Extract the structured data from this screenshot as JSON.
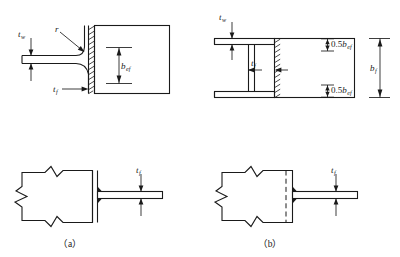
{
  "figure": {
    "captions": [
      {
        "id": "a",
        "label": "（a）"
      },
      {
        "id": "b",
        "label": "（b）"
      }
    ],
    "labels": {
      "web_thickness": "t",
      "web_thickness_sub": "w",
      "flange_thickness": "t",
      "flange_thickness_sub": "f",
      "fillet_radius": "r",
      "effective_width": "b",
      "effective_width_sub": "ef",
      "half_effective_width_value": "0.5",
      "half_effective_width": "b",
      "half_effective_width_sub": "ef",
      "flange_width": "b",
      "flange_width_sub": "f",
      "plate_thickness": "t",
      "plate_thickness_sub": "f"
    },
    "panels": [
      {
        "name": "top-left-section",
        "description": "Rolled section with fillet radius r, web thickness t-w, flange thickness t-f, effective width b-ef",
        "label_keys": [
          "web_thickness",
          "fillet_radius",
          "flange_thickness",
          "effective_width"
        ]
      },
      {
        "name": "top-right-section",
        "description": "Welded channel section, web thickness t-w, flange thickness t-f, two 0.5 b-ef zones, total flange width b-f",
        "label_keys": [
          "web_thickness",
          "flange_thickness",
          "half_effective_width",
          "flange_width"
        ]
      },
      {
        "name": "bottom-left-plan",
        "description": "Plan view of welded connection with double solid line weld and plate thickness t-f",
        "caption": "（a）",
        "label_keys": [
          "plate_thickness"
        ]
      },
      {
        "name": "bottom-right-plan",
        "description": "Plan view of rolled connection with dashed line and plate thickness t-f",
        "caption": "（b）",
        "label_keys": [
          "plate_thickness"
        ]
      }
    ],
    "colors": {
      "stroke": "#1a1a1a",
      "background": "#ffffff"
    }
  }
}
